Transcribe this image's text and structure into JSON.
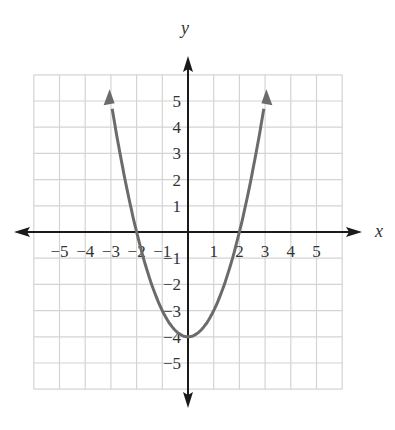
{
  "chart_data": {
    "type": "line",
    "title": "",
    "xlabel": "x",
    "ylabel": "y",
    "equation": "y = x^2 - 4",
    "xlim": [
      -6,
      6
    ],
    "ylim": [
      -6,
      6
    ],
    "grid": true,
    "x_ticks": [
      "-5",
      "-4",
      "-3",
      "-2",
      "-1",
      "1",
      "2",
      "3",
      "4",
      "5"
    ],
    "y_ticks": [
      "5",
      "4",
      "3",
      "2",
      "1",
      "-1",
      "-2",
      "-3",
      "-4",
      "-5"
    ],
    "series": [
      {
        "name": "parabola",
        "color": "#6b6b6b",
        "x": [
          -3.05,
          -3,
          -2.5,
          -2,
          -1.5,
          -1,
          -0.5,
          0,
          0.5,
          1,
          1.5,
          2,
          2.5,
          3,
          3.05
        ],
        "y": [
          5.3,
          5,
          2.25,
          0,
          -1.75,
          -3,
          -3.75,
          -4,
          -3.75,
          -3,
          -1.75,
          0,
          2.25,
          5,
          5.3
        ]
      }
    ],
    "key_points": {
      "vertex": [
        0,
        -4
      ],
      "x_intercepts": [
        [
          -2,
          0
        ],
        [
          2,
          0
        ]
      ],
      "y_intercept": [
        0,
        -4
      ]
    },
    "legend": "none"
  },
  "labels": {
    "x_axis": "x",
    "y_axis": "y"
  },
  "colors": {
    "grid": "#d4d4d4",
    "axis": "#1a1a1a",
    "curve": "#6b6b6b"
  }
}
